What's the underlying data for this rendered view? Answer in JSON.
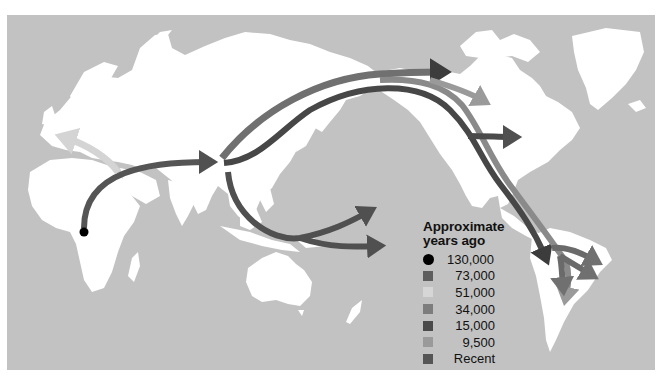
{
  "figure": {
    "type": "world-migration-map",
    "background": "#ffffff",
    "ocean_color": "#c2c2c2",
    "land_color": "#ffffff"
  },
  "legend": {
    "title_line1": "Approximate",
    "title_line2": "years ago",
    "items": [
      {
        "label": "130,000",
        "marker": "dot",
        "color": "#000000"
      },
      {
        "label": "73,000",
        "marker": "square",
        "color": "#5e5e5e"
      },
      {
        "label": "51,000",
        "marker": "square",
        "color": "#d6d6d6"
      },
      {
        "label": "34,000",
        "marker": "square",
        "color": "#7d7d7d"
      },
      {
        "label": "15,000",
        "marker": "square",
        "color": "#4a4a4a"
      },
      {
        "label": "9,500",
        "marker": "square",
        "color": "#9a9a9a"
      },
      {
        "label": "Recent",
        "marker": "square",
        "color": "#555555"
      }
    ]
  },
  "routes": [
    {
      "name": "africa-to-asia",
      "era": "73,000"
    },
    {
      "name": "into-europe",
      "era": "51,000"
    },
    {
      "name": "asia-to-australasia-pacific",
      "era": "73,000"
    },
    {
      "name": "asia-to-north-arctic",
      "era": "34,000"
    },
    {
      "name": "bering-to-americas",
      "era": "15,000"
    },
    {
      "name": "canada-arctic",
      "era": "9,500"
    },
    {
      "name": "south-america-branches",
      "era": "Recent"
    }
  ],
  "origin_marker": {
    "label": "130,000",
    "region": "Central Africa"
  }
}
